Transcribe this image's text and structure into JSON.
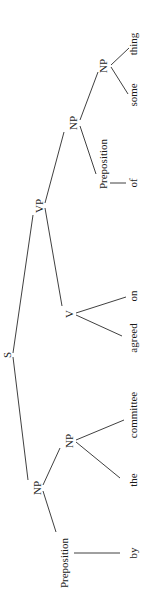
{
  "diagram": {
    "type": "syntax-tree",
    "orientation": "rotated-90-ccw",
    "nodes": {
      "s": "S",
      "np_subject": "NP",
      "prep_by": "Preposition",
      "word_by": "by",
      "np_committee": "NP",
      "word_the": "the",
      "word_committee": "committee",
      "vp": "VP",
      "v": "V",
      "word_agreed": "agreed",
      "word_on": "on",
      "np_object": "NP",
      "prep_of": "Preposition",
      "word_of": "of",
      "np_something": "NP",
      "word_some": "some",
      "word_thing": "thing"
    },
    "structure": {
      "label": "S",
      "children": [
        {
          "label": "NP",
          "children": [
            {
              "label": "Preposition",
              "children": [
                {
                  "label": "by"
                }
              ]
            },
            {
              "label": "NP",
              "children": [
                {
                  "label": "the"
                },
                {
                  "label": "committee"
                }
              ]
            }
          ]
        },
        {
          "label": "VP",
          "children": [
            {
              "label": "V",
              "children": [
                {
                  "label": "agreed"
                },
                {
                  "label": "on"
                }
              ]
            },
            {
              "label": "NP",
              "children": [
                {
                  "label": "Preposition",
                  "children": [
                    {
                      "label": "of"
                    }
                  ]
                },
                {
                  "label": "NP",
                  "children": [
                    {
                      "label": "some"
                    },
                    {
                      "label": "thing"
                    }
                  ]
                }
              ]
            }
          ]
        }
      ]
    }
  }
}
